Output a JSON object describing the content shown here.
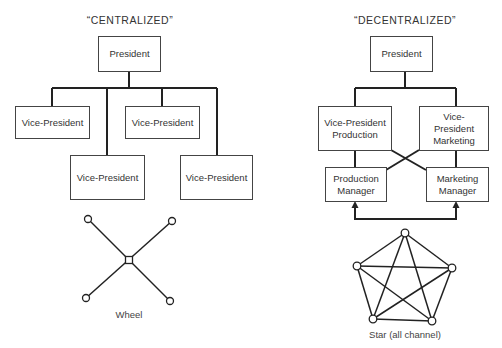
{
  "centralized": {
    "title": "“CENTRALIZED”",
    "president": "President",
    "vps": [
      "Vice-President",
      "Vice-President",
      "Vice-President",
      "Vice-President"
    ],
    "network_label": "Wheel"
  },
  "decentralized": {
    "title": "“DECENTRALIZED”",
    "president": "President",
    "vp_production": "Vice-President Production",
    "vp_marketing": "Vice-President Marketing",
    "production_manager": "Production Manager",
    "marketing_manager": "Marketing Manager",
    "network_label": "Star (all channel)"
  }
}
